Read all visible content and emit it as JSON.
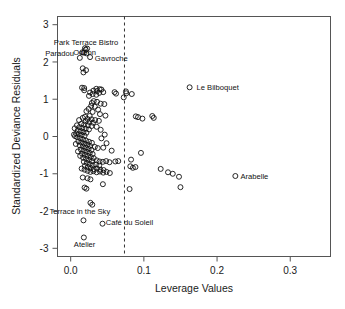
{
  "chart_data": {
    "type": "scatter",
    "title": "",
    "xlabel": "Leverage Values",
    "ylabel": "Standardized Deviance Residuals",
    "xlim": [
      -0.018,
      0.355
    ],
    "ylim": [
      -3.22,
      3.22
    ],
    "xticks": [
      0.0,
      0.1,
      0.2,
      0.3
    ],
    "xtick_labels": [
      "0.0",
      "0.1",
      "0.2",
      "0.3"
    ],
    "yticks": [
      3,
      2,
      1,
      0,
      -1,
      -2,
      -3
    ],
    "ytick_labels": [
      "3",
      "2",
      "1",
      "0",
      "-1",
      "-2",
      "-3"
    ],
    "grid": false,
    "legend": "none",
    "annotations": [
      {
        "text": "Park Terrace Bistro",
        "x": 0.021,
        "y": 2.52,
        "anchor": "middle"
      },
      {
        "text": "Paradou",
        "x": 0.0045,
        "y": 2.24,
        "anchor": "end"
      },
      {
        "text": "Odeon",
        "x": 0.019,
        "y": 2.27,
        "anchor": "middle"
      },
      {
        "text": "Gavroche",
        "x": 0.033,
        "y": 2.1,
        "anchor": "start"
      },
      {
        "text": "Le Bilboquet",
        "x": 0.172,
        "y": 1.32,
        "anchor": "start"
      },
      {
        "text": "Arabelle",
        "x": 0.232,
        "y": -1.06,
        "anchor": "start"
      },
      {
        "text": "Terrace in the Sky",
        "x": 0.0125,
        "y": -2.0,
        "anchor": "middle"
      },
      {
        "text": "Café du Soleil",
        "x": 0.048,
        "y": -2.3,
        "anchor": "start"
      },
      {
        "text": "Atelier",
        "x": 0.019,
        "y": -2.88,
        "anchor": "middle"
      }
    ],
    "cutoff_line": {
      "x": 0.0735,
      "style": "dashed",
      "orientation": "vertical"
    },
    "points": [
      [
        0.0195,
        2.37
      ],
      [
        0.0225,
        2.36
      ],
      [
        0.0205,
        2.33
      ],
      [
        0.016,
        2.26
      ],
      [
        0.018,
        2.25
      ],
      [
        0.0215,
        2.23
      ],
      [
        0.0265,
        2.13
      ],
      [
        0.0125,
        2.11
      ],
      [
        0.0165,
        1.83
      ],
      [
        0.021,
        1.78
      ],
      [
        0.0175,
        1.72
      ],
      [
        0.0155,
        1.31
      ],
      [
        0.0185,
        1.3
      ],
      [
        0.035,
        1.28
      ],
      [
        0.0395,
        1.27
      ],
      [
        0.042,
        1.26
      ],
      [
        0.0185,
        1.24
      ],
      [
        0.031,
        1.23
      ],
      [
        0.036,
        1.22
      ],
      [
        0.0445,
        1.19
      ],
      [
        0.0265,
        1.18
      ],
      [
        0.039,
        1.17
      ],
      [
        0.06,
        1.19
      ],
      [
        0.062,
        1.15
      ],
      [
        0.0755,
        1.21
      ],
      [
        0.076,
        1.16
      ],
      [
        0.0835,
        1.14
      ],
      [
        0.03,
        1.14
      ],
      [
        0.035,
        1.12
      ],
      [
        0.025,
        1.09
      ],
      [
        0.0725,
        1.05
      ],
      [
        0.0315,
        0.95
      ],
      [
        0.036,
        0.93
      ],
      [
        0.029,
        0.9
      ],
      [
        0.041,
        0.88
      ],
      [
        0.046,
        0.87
      ],
      [
        0.028,
        0.82
      ],
      [
        0.033,
        0.8
      ],
      [
        0.0245,
        0.74
      ],
      [
        0.0375,
        0.72
      ],
      [
        0.0215,
        0.68
      ],
      [
        0.03,
        0.66
      ],
      [
        0.04,
        0.6
      ],
      [
        0.0475,
        0.56
      ],
      [
        0.026,
        0.55
      ],
      [
        0.0195,
        0.53
      ],
      [
        0.089,
        0.54
      ],
      [
        0.092,
        0.52
      ],
      [
        0.1115,
        0.55
      ],
      [
        0.1135,
        0.5
      ],
      [
        0.098,
        0.48
      ],
      [
        0.0165,
        0.5
      ],
      [
        0.023,
        0.47
      ],
      [
        0.0285,
        0.46
      ],
      [
        0.0335,
        0.44
      ],
      [
        0.0385,
        0.42
      ],
      [
        0.0205,
        0.41
      ],
      [
        0.0255,
        0.39
      ],
      [
        0.0305,
        0.37
      ],
      [
        0.0145,
        0.34
      ],
      [
        0.0185,
        0.32
      ],
      [
        0.0235,
        0.3
      ],
      [
        0.0285,
        0.28
      ],
      [
        0.012,
        0.25
      ],
      [
        0.016,
        0.23
      ],
      [
        0.0205,
        0.21
      ],
      [
        0.025,
        0.19
      ],
      [
        0.0095,
        0.16
      ],
      [
        0.0135,
        0.14
      ],
      [
        0.0175,
        0.12
      ],
      [
        0.0215,
        0.1
      ],
      [
        0.0075,
        0.08
      ],
      [
        0.011,
        0.06
      ],
      [
        0.015,
        0.04
      ],
      [
        0.019,
        0.02
      ],
      [
        0.0045,
        0.05
      ],
      [
        0.006,
        0.01
      ],
      [
        0.009,
        -0.02
      ],
      [
        0.013,
        -0.05
      ],
      [
        0.017,
        -0.08
      ],
      [
        0.021,
        -0.11
      ],
      [
        0.025,
        -0.14
      ],
      [
        0.029,
        -0.17
      ],
      [
        0.0105,
        -0.13
      ],
      [
        0.0145,
        -0.16
      ],
      [
        0.0185,
        -0.19
      ],
      [
        0.0225,
        -0.22
      ],
      [
        0.0265,
        -0.25
      ],
      [
        0.033,
        -0.28
      ],
      [
        0.037,
        -0.31
      ],
      [
        0.0445,
        -0.3
      ],
      [
        0.0125,
        -0.24
      ],
      [
        0.0165,
        -0.27
      ],
      [
        0.0205,
        -0.3
      ],
      [
        0.0245,
        -0.33
      ],
      [
        0.0285,
        -0.36
      ],
      [
        0.014,
        -0.35
      ],
      [
        0.018,
        -0.38
      ],
      [
        0.022,
        -0.41
      ],
      [
        0.026,
        -0.44
      ],
      [
        0.03,
        -0.47
      ],
      [
        0.0155,
        -0.46
      ],
      [
        0.0195,
        -0.49
      ],
      [
        0.0235,
        -0.52
      ],
      [
        0.0275,
        -0.55
      ],
      [
        0.0315,
        -0.58
      ],
      [
        0.017,
        -0.57
      ],
      [
        0.021,
        -0.6
      ],
      [
        0.025,
        -0.63
      ],
      [
        0.029,
        -0.66
      ],
      [
        0.0355,
        -0.64
      ],
      [
        0.0395,
        -0.67
      ],
      [
        0.044,
        -0.68
      ],
      [
        0.0485,
        -0.66
      ],
      [
        0.053,
        -0.69
      ],
      [
        0.061,
        -0.67
      ],
      [
        0.065,
        -0.66
      ],
      [
        0.018,
        -0.68
      ],
      [
        0.022,
        -0.71
      ],
      [
        0.026,
        -0.74
      ],
      [
        0.03,
        -0.77
      ],
      [
        0.0345,
        -0.75
      ],
      [
        0.039,
        -0.78
      ],
      [
        0.0195,
        -0.79
      ],
      [
        0.0235,
        -0.82
      ],
      [
        0.0275,
        -0.85
      ],
      [
        0.0315,
        -0.88
      ],
      [
        0.036,
        -0.86
      ],
      [
        0.0405,
        -0.89
      ],
      [
        0.045,
        -0.9
      ],
      [
        0.015,
        -0.86
      ],
      [
        0.019,
        -0.89
      ],
      [
        0.023,
        -0.92
      ],
      [
        0.027,
        -0.95
      ],
      [
        0.031,
        -0.93
      ],
      [
        0.0355,
        -0.96
      ],
      [
        0.04,
        -0.94
      ],
      [
        0.0445,
        -0.97
      ],
      [
        0.049,
        -0.95
      ],
      [
        0.0535,
        -0.98
      ],
      [
        0.0815,
        -0.8
      ],
      [
        0.085,
        -0.84
      ],
      [
        0.0885,
        -0.82
      ],
      [
        0.096,
        -0.44
      ],
      [
        0.123,
        -0.87
      ],
      [
        0.133,
        -0.96
      ],
      [
        0.1395,
        -1.0
      ],
      [
        0.148,
        -1.08
      ],
      [
        0.225,
        -1.06
      ],
      [
        0.15,
        -1.36
      ],
      [
        0.0165,
        -1.1
      ],
      [
        0.023,
        -1.12
      ],
      [
        0.027,
        -1.15
      ],
      [
        0.019,
        -1.37
      ],
      [
        0.0215,
        -1.4
      ],
      [
        0.044,
        -1.28
      ],
      [
        0.0805,
        -1.41
      ],
      [
        0.027,
        -1.78
      ],
      [
        0.0295,
        -1.83
      ],
      [
        0.0175,
        -2.25
      ],
      [
        0.0435,
        -2.34
      ],
      [
        0.018,
        -2.71
      ],
      [
        0.1625,
        1.32
      ],
      [
        0.0825,
        -0.62
      ],
      [
        0.0055,
        0.22
      ],
      [
        0.007,
        -0.2
      ],
      [
        0.0085,
        0.3
      ],
      [
        0.01,
        -0.4
      ],
      [
        0.0115,
        0.44
      ],
      [
        0.013,
        -0.52
      ],
      [
        0.0355,
        0.26
      ],
      [
        0.041,
        0.18
      ],
      [
        0.0465,
        0.05
      ],
      [
        0.042,
        -0.05
      ],
      [
        0.049,
        -0.18
      ],
      [
        0.056,
        -0.38
      ]
    ]
  }
}
